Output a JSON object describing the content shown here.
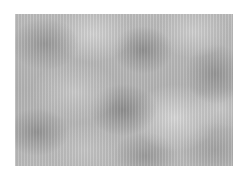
{
  "image": {
    "description": "grayscale cloud noise texture",
    "background_color": "#ffffff",
    "texture_base_color": "#b8b8b8",
    "texture_dark_color": "#8c8c8c",
    "texture_light_color": "#dcdcdc"
  }
}
